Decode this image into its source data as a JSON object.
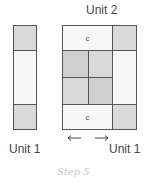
{
  "diagram": {
    "title_unit2": "Unit 2",
    "label_unit1_left": "Unit 1",
    "label_unit1_right": "Unit 1",
    "cell_label_c": "c",
    "step_label": "Step 5",
    "colors": {
      "shaded": "#d9d9d9",
      "light": "#f7f7f7",
      "outline": "#555555"
    }
  }
}
